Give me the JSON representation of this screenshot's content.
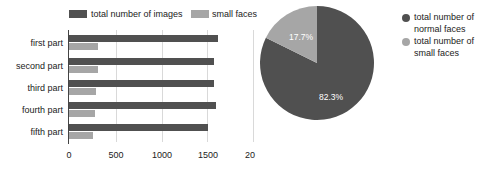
{
  "chart_data": [
    {
      "type": "bar",
      "orientation": "horizontal",
      "title": "",
      "xlabel": "",
      "ylabel": "",
      "categories": [
        "first part",
        "second part",
        "third part",
        "fourth part",
        "fifth part"
      ],
      "series": [
        {
          "name": "total number of images",
          "color": "#505050",
          "values": [
            1607,
            1564,
            1564,
            1586,
            1500
          ]
        },
        {
          "name": "small faces",
          "color": "#a6a6a6",
          "values": [
            313,
            313,
            291,
            280,
            259
          ]
        }
      ],
      "xticks": [
        "0",
        "500",
        "1000",
        "1500",
        "20"
      ],
      "xlim": [
        0,
        2000
      ],
      "grid": true,
      "legend_position": "top"
    },
    {
      "type": "pie",
      "title": "",
      "labels": [
        "total number of normal faces",
        "total number of small faces"
      ],
      "values": [
        82.3,
        17.7
      ],
      "value_labels": [
        "82.3%",
        "17.7%"
      ],
      "colors": [
        "#505050",
        "#a6a6a6"
      ],
      "legend_position": "right"
    }
  ],
  "bar_chart": {
    "legend": [
      {
        "label": "total number of images",
        "color": "#505050"
      },
      {
        "label": "small faces",
        "color": "#a6a6a6"
      }
    ],
    "categories": [
      "first part",
      "second part",
      "third part",
      "fourth part",
      "fifth part"
    ],
    "ticks": [
      "0",
      "500",
      "1000",
      "1500",
      "20"
    ]
  },
  "pie_chart": {
    "slice_labels": {
      "normal": "82.3%",
      "small": "17.7%"
    },
    "legend": [
      {
        "line1": "total number of",
        "line2": "normal faces",
        "color": "#505050"
      },
      {
        "line1": "total number of",
        "line2": "small faces",
        "color": "#a6a6a6"
      }
    ]
  }
}
